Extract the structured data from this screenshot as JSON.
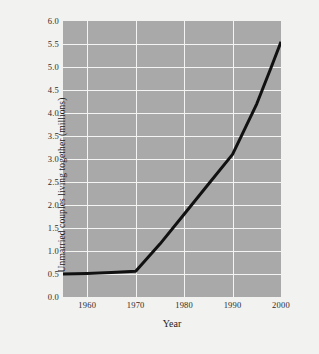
{
  "chart_data": {
    "type": "line",
    "title": "",
    "xlabel": "Year",
    "ylabel": "Unmarried couples living together (millions)",
    "xlim": [
      1955,
      2000
    ],
    "ylim": [
      0.0,
      6.0
    ],
    "grid": true,
    "legend": false,
    "x_ticks": [
      "1960",
      "1970",
      "1980",
      "1990",
      "2000"
    ],
    "x_tick_values": [
      1960,
      1970,
      1980,
      1990,
      2000
    ],
    "y_ticks": [
      "0.0",
      "0.5",
      "1.0",
      "1.5",
      "2.0",
      "2.5",
      "3.0",
      "3.5",
      "4.0",
      "4.5",
      "5.0",
      "5.5",
      "6.0"
    ],
    "y_tick_values": [
      0.0,
      0.5,
      1.0,
      1.5,
      2.0,
      2.5,
      3.0,
      3.5,
      4.0,
      4.5,
      5.0,
      5.5,
      6.0
    ],
    "x": [
      1955,
      1960,
      1965,
      1970,
      1975,
      1980,
      1985,
      1990,
      1995,
      1998,
      2000
    ],
    "values": [
      0.5,
      0.51,
      0.53,
      0.56,
      1.15,
      1.8,
      2.45,
      3.1,
      4.2,
      5.0,
      5.55
    ],
    "series": [
      {
        "name": "Unmarried couples living together",
        "color": "#111111",
        "values": [
          0.5,
          0.51,
          0.53,
          0.56,
          1.15,
          1.8,
          2.45,
          3.1,
          4.2,
          5.0,
          5.55
        ]
      }
    ],
    "colors": {
      "plot_background": "#a9a9a9",
      "page_background": "#f2f2f0",
      "gridline": "#f4f4f2",
      "line": "#111111",
      "text": "#23231f"
    }
  }
}
